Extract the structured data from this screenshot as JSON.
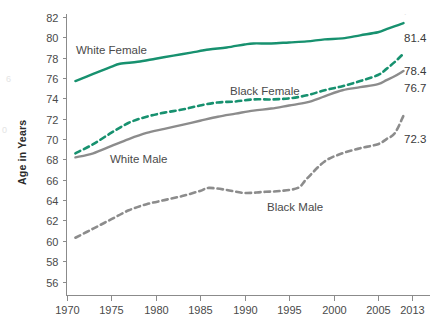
{
  "chart_data": {
    "type": "line",
    "title": "",
    "subtitle": "",
    "xlabel": "",
    "ylabel": "Age in Years",
    "xlim": [
      1970,
      2013
    ],
    "ylim": [
      55,
      82
    ],
    "grid": false,
    "legend_position": "inline-labels",
    "xticks": [
      "1970",
      "1975",
      "1980",
      "1985",
      "1990",
      "1995",
      "2000",
      "2005",
      "2013"
    ],
    "xtick_values": [
      1970,
      1975,
      1980,
      1985,
      1990,
      1995,
      2000,
      2005,
      2013
    ],
    "yticks": [
      "56",
      "58",
      "60",
      "62",
      "64",
      "66",
      "68",
      "70",
      "72",
      "74",
      "76",
      "78",
      "80",
      "82"
    ],
    "ytick_values": [
      56,
      58,
      60,
      62,
      64,
      66,
      68,
      70,
      72,
      74,
      76,
      78,
      80,
      82
    ],
    "series": [
      {
        "name": "White Female",
        "color": "#17916f",
        "style": "solid",
        "end_label": "81.4",
        "x": [
          1971,
          1973,
          1975,
          1976,
          1978,
          1980,
          1982,
          1984,
          1986,
          1988,
          1990,
          1991,
          1993,
          1995,
          1997,
          1999,
          2001,
          2003,
          2005,
          2007,
          2009,
          2011
        ],
        "values": [
          75.7,
          76.4,
          77.1,
          77.4,
          77.6,
          77.9,
          78.2,
          78.5,
          78.8,
          79.0,
          79.3,
          79.4,
          79.4,
          79.5,
          79.6,
          79.8,
          79.9,
          80.2,
          80.5,
          80.8,
          81.1,
          81.4
        ]
      },
      {
        "name": "Black Female",
        "color": "#17916f",
        "style": "dashed",
        "end_label": "78.4",
        "x": [
          1971,
          1973,
          1975,
          1977,
          1979,
          1981,
          1983,
          1985,
          1987,
          1989,
          1991,
          1993,
          1995,
          1997,
          1999,
          2001,
          2003,
          2005,
          2007,
          2009,
          2011
        ],
        "values": [
          68.6,
          69.5,
          70.6,
          71.6,
          72.2,
          72.6,
          72.9,
          73.3,
          73.6,
          73.7,
          73.9,
          73.9,
          74.0,
          74.3,
          74.8,
          75.2,
          75.7,
          76.3,
          76.9,
          77.6,
          78.4
        ]
      },
      {
        "name": "White Male",
        "color": "#8c8c8c",
        "style": "solid",
        "end_label": "76.7",
        "x": [
          1971,
          1973,
          1975,
          1977,
          1979,
          1981,
          1983,
          1985,
          1987,
          1989,
          1991,
          1993,
          1995,
          1997,
          1999,
          2001,
          2003,
          2005,
          2007,
          2009,
          2011
        ],
        "values": [
          68.2,
          68.6,
          69.3,
          70.0,
          70.6,
          71.0,
          71.4,
          71.8,
          72.2,
          72.5,
          72.8,
          73.0,
          73.3,
          73.6,
          74.2,
          74.8,
          75.1,
          75.4,
          75.8,
          76.2,
          76.7
        ]
      },
      {
        "name": "Black Male",
        "color": "#8c8c8c",
        "style": "dashed",
        "end_label": "72.3",
        "x": [
          1971,
          1973,
          1975,
          1977,
          1979,
          1981,
          1983,
          1985,
          1986,
          1988,
          1990,
          1992,
          1994,
          1996,
          1997,
          1999,
          2001,
          2003,
          2005,
          2007,
          2009,
          2011
        ],
        "values": [
          60.3,
          61.2,
          62.1,
          63.0,
          63.6,
          64.0,
          64.4,
          64.9,
          65.2,
          65.0,
          64.7,
          64.8,
          64.9,
          65.2,
          66.1,
          67.8,
          68.6,
          69.1,
          69.5,
          70.0,
          70.6,
          72.3
        ]
      }
    ]
  },
  "labels": {
    "white_female": "White Female",
    "black_female": "Black Female",
    "white_male": "White Male",
    "black_male": "Black Male",
    "y_axis_title": "Age in Years"
  },
  "end_labels": {
    "white_female": "81.4",
    "black_female": "78.4",
    "white_male": "76.7",
    "black_male": "72.3"
  },
  "colors": {
    "teal": "#17916f",
    "gray": "#8c8c8c",
    "axis": "#8b8b8b",
    "text": "#4a4a4a",
    "background": "#ffffff"
  }
}
